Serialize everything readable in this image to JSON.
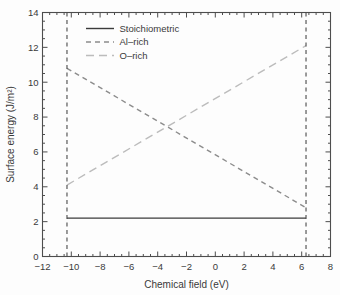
{
  "chart_data": {
    "type": "line",
    "title": "",
    "xlabel": "Chemical field (eV)",
    "ylabel": "Surface energy (J/m²)",
    "xlim": [
      -12,
      8
    ],
    "ylim": [
      0,
      14
    ],
    "x_major_ticks": [
      -12,
      -10,
      -8,
      -6,
      -4,
      -2,
      0,
      2,
      4,
      6,
      8
    ],
    "y_major_ticks": [
      0,
      2,
      4,
      6,
      8,
      10,
      12,
      14
    ],
    "minor_tick_step": 0.5,
    "grid": false,
    "legend_position": "upper-left",
    "frame_color": "#4d4d4d",
    "text_color": "#3a3a3a",
    "background_color": "#fdfdfd",
    "series": [
      {
        "name": "Stoichiometric",
        "line_style": "solid",
        "dash": "",
        "color": "#3b3b3b",
        "points": [
          [
            -10.3,
            2.2
          ],
          [
            6.3,
            2.2
          ]
        ]
      },
      {
        "name": "Al–rich",
        "line_style": "dashed",
        "dash": "5,4",
        "color": "#8c8c8c",
        "points": [
          [
            -10.3,
            10.8
          ],
          [
            6.3,
            2.8
          ]
        ]
      },
      {
        "name": "O–rich",
        "line_style": "dashed",
        "dash": "8,5",
        "color": "#bcbcbc",
        "points": [
          [
            -10.3,
            4.1
          ],
          [
            6.3,
            12.1
          ]
        ]
      }
    ],
    "vlines": [
      {
        "x": -10.3,
        "line_style": "dashed",
        "dash": "4,3.5",
        "color": "#4a4a4a"
      },
      {
        "x": 6.3,
        "line_style": "dashed",
        "dash": "4,3.5",
        "color": "#4a4a4a"
      }
    ]
  }
}
